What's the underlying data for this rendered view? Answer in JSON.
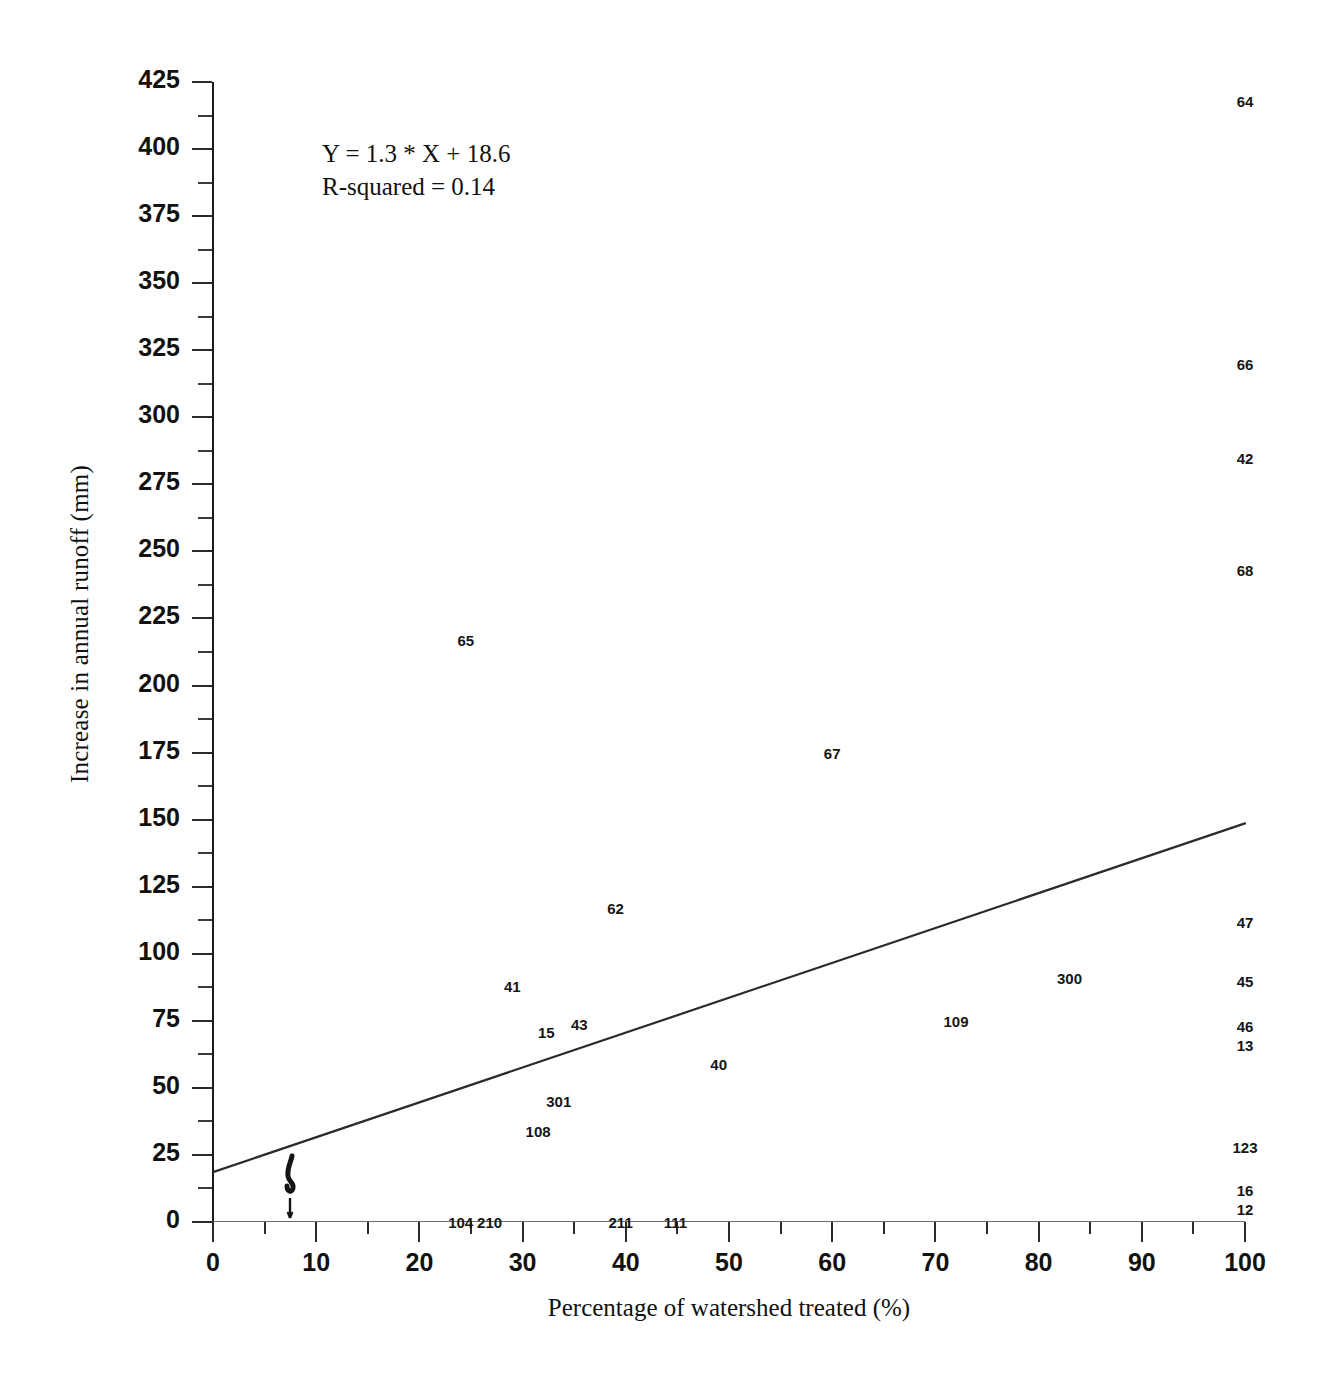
{
  "chart_data": {
    "type": "scatter",
    "title": "",
    "xlabel": "Percentage of watershed treated (%)",
    "ylabel": "Increase in annual runoff (mm)",
    "xlim": [
      0,
      100
    ],
    "ylim": [
      0,
      425
    ],
    "grid": false,
    "legend": null,
    "x_ticks": [
      0,
      10,
      20,
      30,
      40,
      50,
      60,
      70,
      80,
      90,
      100
    ],
    "x_tick_labels": [
      "0",
      "10",
      "20",
      "30",
      "40",
      "50",
      "60",
      "70",
      "80",
      "90",
      "100"
    ],
    "y_ticks": [
      0,
      25,
      50,
      75,
      100,
      125,
      150,
      175,
      200,
      225,
      250,
      275,
      300,
      325,
      350,
      375,
      400,
      425
    ],
    "y_tick_labels": [
      "0",
      "25",
      "50",
      "75",
      "100",
      "125",
      "150",
      "175",
      "200",
      "225",
      "250",
      "275",
      "300",
      "325",
      "350",
      "375",
      "400",
      "425"
    ],
    "y_minor_ticks": [
      12.5,
      37.5,
      62.5,
      87.5,
      112.5,
      137.5,
      162.5,
      187.5,
      212.5,
      237.5,
      262.5,
      287.5,
      312.5,
      337.5,
      362.5,
      387.5,
      412.5
    ],
    "annotations": {
      "equation": "Y = 1.3 * X + 18.6",
      "r_squared": "R-squared = 0.14"
    },
    "trendline": {
      "kind": "linear",
      "slope": 1.3,
      "intercept": 18.6,
      "r_squared": 0.14,
      "x_start": 0,
      "y_start": 18.6,
      "x_end": 100,
      "y_end": 148.6
    },
    "point_label_field": "watershed id",
    "points": [
      {
        "label": "64",
        "x": 100,
        "y": 418
      },
      {
        "label": "66",
        "x": 100,
        "y": 320
      },
      {
        "label": "42",
        "x": 100,
        "y": 285
      },
      {
        "label": "68",
        "x": 100,
        "y": 243
      },
      {
        "label": "47",
        "x": 100,
        "y": 112
      },
      {
        "label": "45",
        "x": 100,
        "y": 90
      },
      {
        "label": "46",
        "x": 100,
        "y": 73
      },
      {
        "label": "13",
        "x": 100,
        "y": 66
      },
      {
        "label": "123",
        "x": 100,
        "y": 28
      },
      {
        "label": "16",
        "x": 100,
        "y": 12
      },
      {
        "label": "12",
        "x": 100,
        "y": 5
      },
      {
        "label": "65",
        "x": 24.5,
        "y": 217
      },
      {
        "label": "67",
        "x": 60,
        "y": 175
      },
      {
        "label": "62",
        "x": 39,
        "y": 117
      },
      {
        "label": "300",
        "x": 83,
        "y": 91
      },
      {
        "label": "41",
        "x": 29,
        "y": 88
      },
      {
        "label": "109",
        "x": 72,
        "y": 75
      },
      {
        "label": "43",
        "x": 35.5,
        "y": 74
      },
      {
        "label": "15",
        "x": 32.3,
        "y": 71
      },
      {
        "label": "40",
        "x": 49,
        "y": 59
      },
      {
        "label": "301",
        "x": 33.5,
        "y": 45
      },
      {
        "label": "108",
        "x": 31.5,
        "y": 34
      },
      {
        "label": "104",
        "x": 24,
        "y": 0
      },
      {
        "label": "210",
        "x": 26.8,
        "y": 0
      },
      {
        "label": "211",
        "x": 39.5,
        "y": 0
      },
      {
        "label": "111",
        "x": 44.8,
        "y": 0
      }
    ]
  }
}
